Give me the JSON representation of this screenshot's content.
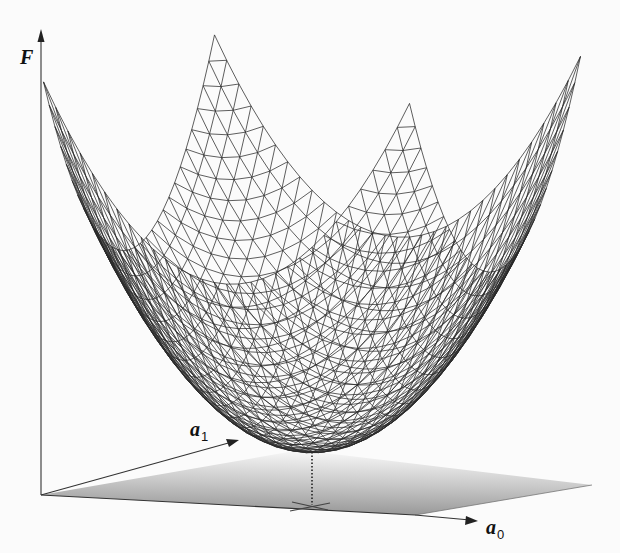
{
  "figure": {
    "axes": {
      "vertical": {
        "label": "F"
      },
      "depth": {
        "label": "a",
        "subscript": "1"
      },
      "horizontal": {
        "label": "a",
        "subscript": "0"
      }
    },
    "colors": {
      "background": "#fbfbfb",
      "mesh": "#2a2a2a",
      "axis": "#333333",
      "plane_dark": "#9a9a9a",
      "plane_light": "#f2f2f2"
    },
    "surface": {
      "type": "paraboloid",
      "grid_divisions": 30,
      "projection": {
        "origin": [
          312,
          452
        ],
        "a": 183,
        "b": 85.5,
        "c": 10.75,
        "d": -23.5,
        "k": 191.4
      }
    },
    "minimum_marker": {
      "x": 312,
      "y_surface": 452,
      "y_plane": 505
    }
  }
}
